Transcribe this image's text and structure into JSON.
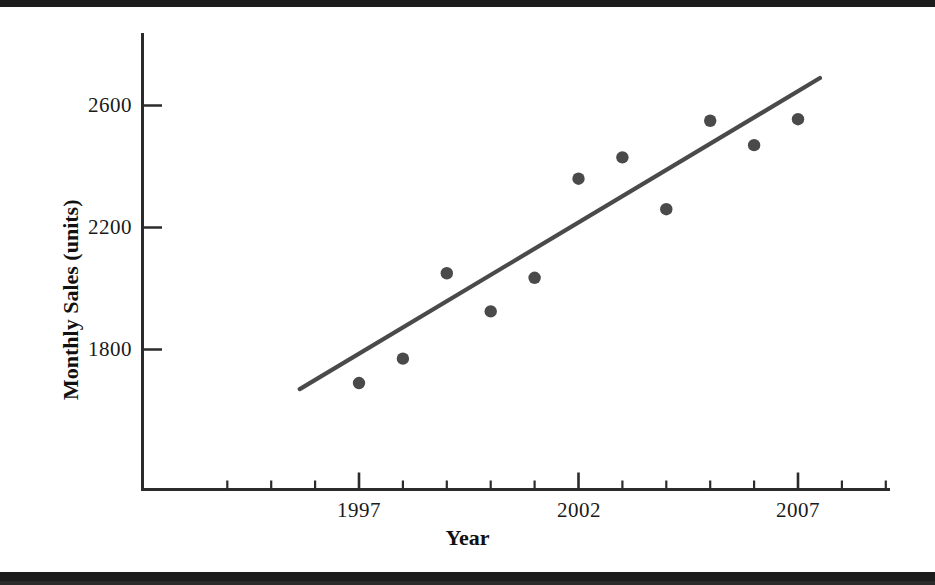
{
  "chart_data": {
    "type": "scatter",
    "title": "",
    "xlabel": "Year",
    "ylabel": "Monthly Sales (units)",
    "xlim": [
      1993.2,
      2009.5
    ],
    "ylim": [
      1320,
      2790
    ],
    "grid": false,
    "legend": null,
    "x_major_ticks": [
      1997,
      2002,
      2007
    ],
    "x_major_tick_labels": [
      "1997",
      "2002",
      "2007"
    ],
    "x_minor_ticks": [
      1994,
      1995,
      1996,
      1998,
      1999,
      2000,
      2001,
      2003,
      2004,
      2005,
      2006,
      2008,
      2009
    ],
    "y_ticks": [
      1800,
      2200,
      2600
    ],
    "y_tick_labels": [
      "1800",
      "2200",
      "2600"
    ],
    "x": [
      1997,
      1998,
      1999,
      2000,
      2001,
      2002,
      2003,
      2004,
      2005,
      2006,
      2007
    ],
    "values": [
      1690,
      1770,
      2050,
      1925,
      2035,
      2360,
      2430,
      2260,
      2550,
      2470,
      2555
    ],
    "series": [
      {
        "name": "Monthly Sales",
        "marker": "filled-circle",
        "color": "#4a4a4a",
        "x": [
          1997,
          1998,
          1999,
          2000,
          2001,
          2002,
          2003,
          2004,
          2005,
          2006,
          2007
        ],
        "values": [
          1690,
          1770,
          2050,
          1925,
          2035,
          2360,
          2430,
          2260,
          2550,
          2470,
          2555
        ]
      },
      {
        "name": "Trend Line",
        "type": "line",
        "color": "#4a4a4a",
        "x": [
          1995.65,
          2007.5
        ],
        "values": [
          1670,
          2690
        ]
      }
    ],
    "annotations": []
  },
  "axes": {
    "x_title": "Year",
    "y_title": "Monthly Sales (units)",
    "y_tick_1": "1800",
    "y_tick_2": "2200",
    "y_tick_3": "2600",
    "x_tick_1": "1997",
    "x_tick_2": "2002",
    "x_tick_3": "2007"
  },
  "colors": {
    "axis": "#2b2b2b",
    "marker": "#4a4a4a",
    "trend": "#4a4a4a",
    "text": "#141414",
    "background": "#ffffff",
    "scan_band": "#1c1c1c"
  }
}
